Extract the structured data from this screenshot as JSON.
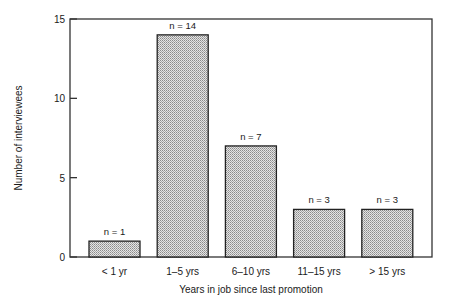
{
  "chart_data": {
    "type": "bar",
    "title": "",
    "xlabel": "Years in job since last promotion",
    "ylabel": "Number of interviewees",
    "categories": [
      "< 1 yr",
      "1–5 yrs",
      "6–10 yrs",
      "11–15 yrs",
      "> 15 yrs"
    ],
    "values": [
      1,
      14,
      7,
      3,
      3
    ],
    "data_labels": [
      "n = 1",
      "n = 14",
      "n = 7",
      "n = 3",
      "n = 3"
    ],
    "ylim": [
      0,
      15
    ],
    "yticks": [
      0,
      5,
      10,
      15
    ],
    "grid": false,
    "legend": null,
    "bar_fill": "stippled gray",
    "colors": {
      "bar_fill": "#c8c8c8",
      "bar_stroke": "#222222",
      "axis": "#333333"
    }
  }
}
